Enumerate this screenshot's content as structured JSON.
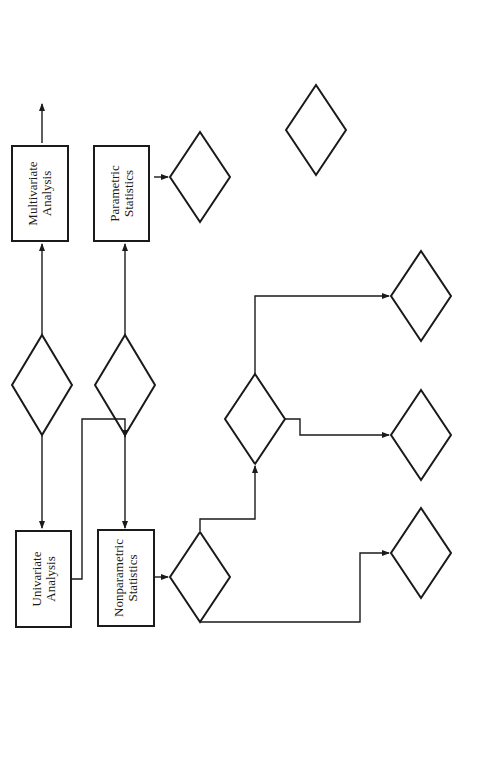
{
  "figure_reference": "Figure 13-2",
  "nodes": {
    "number_of_variables": {
      "line1": "Number",
      "line2": "of Variables"
    },
    "univariate": {
      "line1": "Univariate",
      "line2": "Analysis"
    },
    "multivariate": {
      "line1": "Multivariate",
      "line2": "Analysis"
    },
    "level_of_measurement_top": {
      "line1": "Level of",
      "line2": "Measurement"
    },
    "nonparametric": {
      "line1": "Nonparametric",
      "line2": "Statistics"
    },
    "parametric": {
      "line1": "Parametric",
      "line2": "Statistics"
    },
    "np_number_of_samples": {
      "line1": "Number of",
      "line2": "Samples?"
    },
    "p_number_of_samples": {
      "line1": "Number of",
      "line2": "Samples?"
    },
    "np_relationship": {
      "line1": "Relationship",
      "line2": "of Samples?"
    },
    "p_relationship": {
      "line1": "Relationship",
      "line2": "of Samples"
    },
    "lom_one": {
      "line1": "Level of",
      "line2": "Measurement?"
    },
    "lom_independent": {
      "line1": "Level of",
      "line2": "Measurement?"
    },
    "lom_dependent": {
      "line1": "Level of",
      "line2": "Measurement?"
    },
    "chi_square_one": {
      "line1": "Chi-square"
    },
    "kolmogorov": {
      "line1": "Kolmogorov-",
      "line2": "Smirnov"
    },
    "chi_square_indep": {
      "line1": "Chi-square"
    },
    "mann_whitney": {
      "line1": "Mann-Whitney",
      "line2": "Median Test",
      "line3": "Kruskal-Wallis",
      "star": "*"
    },
    "mcnemar": {
      "line1": "McNemar",
      "line2": "Cochran",
      "q": "Q",
      "star": "*"
    },
    "wilcoxon": {
      "line1": "Wilcoxon",
      "line2": "Friedman 2-Way",
      "line3": "Analysis of",
      "line4": "Variance",
      "star": "*"
    },
    "z_t_one": {
      "z": "z",
      "t": "t",
      "test": "test"
    },
    "z_t_anova": {
      "z": "z",
      "t": "t",
      "test": "test",
      "line3": "Analysis of",
      "line4": "Variance"
    },
    "t_dependent": {
      "t": "t",
      "sub": "r",
      "test": "test"
    }
  },
  "edge_labels": {
    "one": "One",
    "two_or_more": "Two or More",
    "nominal": "Nominal (N)",
    "ordinal": "Ordinal (O)",
    "interval": "Interval (I)",
    "ratio": "Ratio (R)",
    "dependent": "Dependent",
    "independent": "Independent",
    "n": "N",
    "o": "O"
  }
}
